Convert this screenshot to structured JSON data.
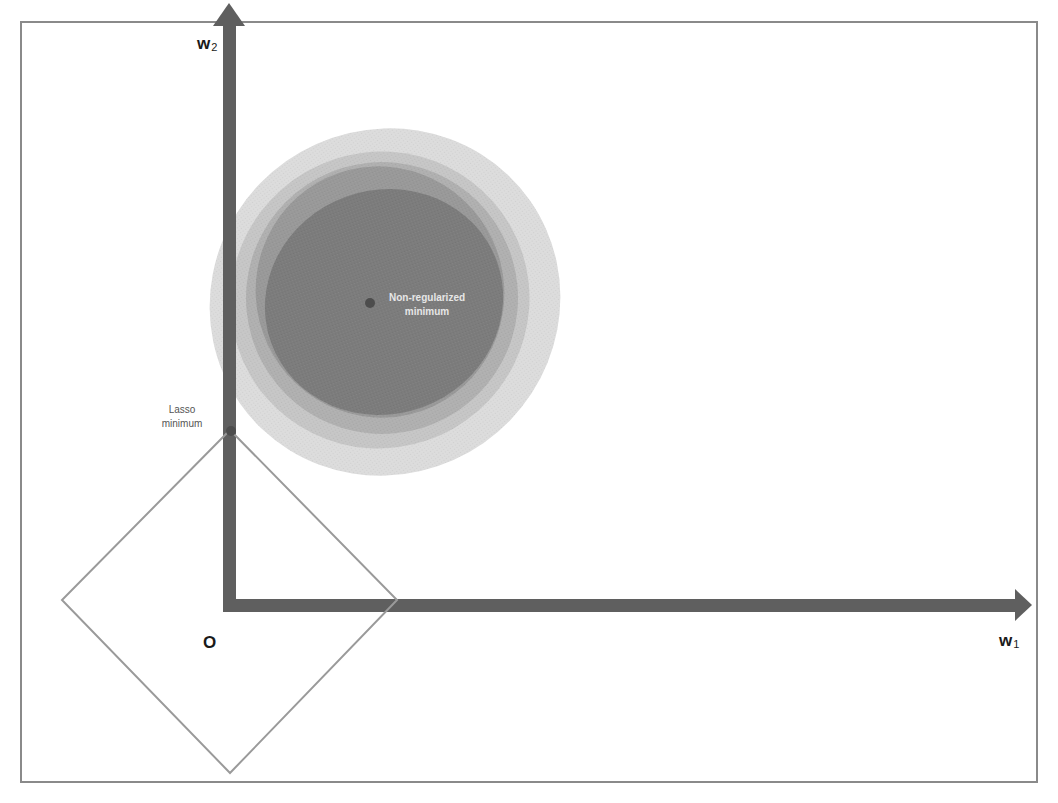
{
  "diagram": {
    "title": "",
    "axes": {
      "x_label": {
        "main": "w",
        "subscript": "1"
      },
      "y_label": {
        "main": "w",
        "subscript": "2"
      },
      "origin_label": "O"
    },
    "annotations": {
      "non_regularized_minimum": [
        "Non-regularized",
        "minimum"
      ],
      "lasso_minimum": [
        "Lasso",
        "minimum"
      ]
    },
    "contours": {
      "count": 5,
      "colors": [
        "#dcdcdc",
        "#c6c6c6",
        "#b0b0b0",
        "#999999",
        "#7c7c7c"
      ]
    },
    "constraint_region": {
      "shape": "diamond",
      "norm": "L1",
      "stroke_color": "#9a9a9a"
    },
    "colors": {
      "axis": "#5f5f5f",
      "point": "#4d4d4d",
      "frame": "#8a8a8a"
    }
  }
}
